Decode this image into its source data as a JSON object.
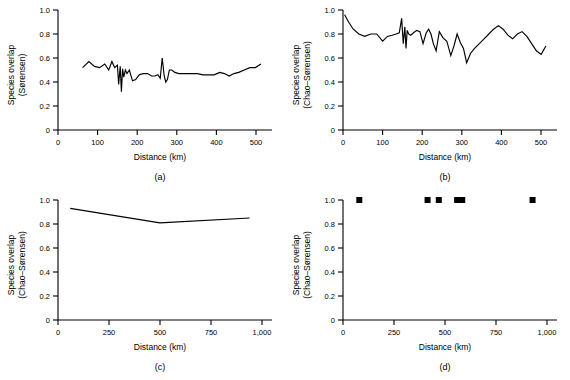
{
  "figure": {
    "background": "#ffffff",
    "line_color": "#000000",
    "panel_labels": [
      "(a)",
      "(b)",
      "(c)",
      "(d)"
    ]
  },
  "chart_data": [
    {
      "type": "line",
      "panel": "(a)",
      "title": "",
      "xlabel": "Distance (km)",
      "ylabel": "Species overlap (Sørensen)",
      "ylabel_line1": "Species overlap",
      "ylabel_line2": "(Sørensen)",
      "xlim": [
        0,
        540
      ],
      "ylim": [
        0,
        1.0
      ],
      "xticks": [
        0,
        100,
        200,
        300,
        400,
        500
      ],
      "xticklabels": [
        "0",
        "100",
        "200",
        "300",
        "400",
        "500"
      ],
      "yticks": [
        0,
        0.2,
        0.4,
        0.6,
        0.8,
        1.0
      ],
      "yticklabels": [
        "0",
        "0.2",
        "0.4",
        "0.6",
        "0.8",
        "1.0"
      ],
      "grid": false,
      "legend": "none",
      "x": [
        62,
        78,
        92,
        105,
        118,
        128,
        136,
        143,
        150,
        153,
        157,
        160,
        163,
        166,
        170,
        174,
        180,
        188,
        196,
        205,
        215,
        226,
        236,
        245,
        252,
        258,
        263,
        268,
        272,
        276,
        281,
        287,
        295,
        305,
        316,
        328,
        340,
        352,
        366,
        380,
        394,
        408,
        420,
        432,
        444,
        456,
        470,
        484,
        498,
        512
      ],
      "y": [
        0.52,
        0.57,
        0.53,
        0.52,
        0.55,
        0.5,
        0.57,
        0.52,
        0.54,
        0.38,
        0.53,
        0.32,
        0.51,
        0.44,
        0.5,
        0.47,
        0.5,
        0.41,
        0.42,
        0.46,
        0.47,
        0.47,
        0.45,
        0.45,
        0.46,
        0.43,
        0.6,
        0.45,
        0.4,
        0.42,
        0.5,
        0.5,
        0.48,
        0.47,
        0.47,
        0.47,
        0.47,
        0.47,
        0.46,
        0.46,
        0.46,
        0.48,
        0.47,
        0.45,
        0.47,
        0.48,
        0.5,
        0.52,
        0.52,
        0.55
      ]
    },
    {
      "type": "line",
      "panel": "(b)",
      "title": "",
      "xlabel": "Distance (km)",
      "ylabel": "Species overlap (Chao–Sørensen)",
      "ylabel_line1": "Species overlap",
      "ylabel_line2": "(Chao–Sørensen)",
      "xlim": [
        0,
        540
      ],
      "ylim": [
        0,
        1.0
      ],
      "xticks": [
        0,
        100,
        200,
        300,
        400,
        500
      ],
      "xticklabels": [
        "0",
        "100",
        "200",
        "300",
        "400",
        "500"
      ],
      "yticks": [
        0,
        0.2,
        0.4,
        0.6,
        0.8,
        1.0
      ],
      "yticklabels": [
        "0",
        "0.2",
        "0.4",
        "0.6",
        "0.8",
        "1.0"
      ],
      "grid": false,
      "legend": "none",
      "x": [
        4,
        14,
        26,
        40,
        55,
        70,
        85,
        100,
        112,
        124,
        134,
        142,
        148,
        152,
        156,
        159,
        162,
        166,
        171,
        178,
        186,
        194,
        202,
        210,
        216,
        222,
        228,
        235,
        243,
        252,
        262,
        272,
        280,
        288,
        296,
        304,
        312,
        322,
        332,
        344,
        356,
        368,
        380,
        392,
        404,
        416,
        428,
        440,
        452,
        464,
        476,
        488,
        500,
        512
      ],
      "y": [
        0.96,
        0.9,
        0.84,
        0.8,
        0.78,
        0.8,
        0.8,
        0.74,
        0.78,
        0.79,
        0.8,
        0.81,
        0.93,
        0.72,
        0.86,
        0.68,
        0.83,
        0.8,
        0.79,
        0.81,
        0.83,
        0.82,
        0.72,
        0.81,
        0.84,
        0.8,
        0.72,
        0.66,
        0.82,
        0.77,
        0.74,
        0.62,
        0.7,
        0.8,
        0.73,
        0.68,
        0.56,
        0.64,
        0.68,
        0.72,
        0.76,
        0.8,
        0.84,
        0.87,
        0.84,
        0.79,
        0.76,
        0.8,
        0.82,
        0.78,
        0.72,
        0.66,
        0.63,
        0.7
      ]
    },
    {
      "type": "line",
      "panel": "(c)",
      "title": "",
      "xlabel": "Distance (km)",
      "ylabel": "Species overlap (Chao–Sørensen)",
      "ylabel_line1": "Species overlap",
      "ylabel_line2": "(Chao–Sørensen)",
      "xlim": [
        0,
        1050
      ],
      "ylim": [
        0,
        1.0
      ],
      "xticks": [
        0,
        250,
        500,
        750,
        1000
      ],
      "xticklabels": [
        "0",
        "250",
        "500",
        "750",
        "1,000"
      ],
      "yticks": [
        0,
        0.2,
        0.4,
        0.6,
        0.8,
        1.0
      ],
      "yticklabels": [
        "0",
        "0.2",
        "0.4",
        "0.6",
        "0.8",
        "1.0"
      ],
      "grid": false,
      "legend": "none",
      "x": [
        60,
        500,
        940
      ],
      "y": [
        0.93,
        0.81,
        0.85
      ]
    },
    {
      "type": "scatter",
      "panel": "(d)",
      "title": "",
      "xlabel": "Distance (km)",
      "ylabel": "Species overlap (Chao–Sørensen)",
      "ylabel_line1": "Species overlap",
      "ylabel_line2": "(Chao–Sørensen)",
      "xlim": [
        0,
        1050
      ],
      "ylim": [
        0,
        1.0
      ],
      "xticks": [
        0,
        250,
        500,
        750,
        1000
      ],
      "xticklabels": [
        "0",
        "250",
        "500",
        "750",
        "1,000"
      ],
      "yticks": [
        0,
        0.2,
        0.4,
        0.6,
        0.8,
        1.0
      ],
      "yticklabels": [
        "0",
        "0.2",
        "0.4",
        "0.6",
        "0.8",
        "1.0"
      ],
      "grid": false,
      "legend": "none",
      "marker": "square",
      "x": [
        80,
        415,
        470,
        560,
        585,
        930
      ],
      "y": [
        1.0,
        1.0,
        1.0,
        1.0,
        1.0,
        1.0
      ]
    }
  ]
}
